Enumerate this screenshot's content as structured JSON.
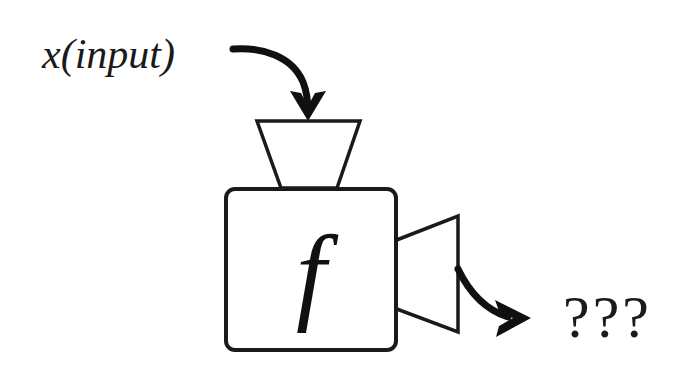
{
  "figure": {
    "background_color": "#ffffff",
    "ink_color": "#1a1a1a",
    "width": 674,
    "height": 376
  },
  "labels": {
    "input_label": "x(input)",
    "function_label": "f",
    "output_label": "???"
  },
  "nodes": {
    "input_funnel": {
      "name": "input-funnel",
      "shape": "trapezoid",
      "orientation": "narrowing-downward"
    },
    "function_box": {
      "name": "function-box",
      "shape": "rounded-square"
    },
    "output_funnel": {
      "name": "output-funnel",
      "shape": "trapezoid",
      "orientation": "widening-rightward"
    }
  },
  "edges": {
    "input_arrow": {
      "name": "input-arrow",
      "from": "x(input)",
      "to": "input-funnel",
      "style": "curved-arrow"
    },
    "output_arrow": {
      "name": "output-arrow",
      "from": "output-funnel",
      "to": "???",
      "style": "curved-arrow"
    }
  }
}
